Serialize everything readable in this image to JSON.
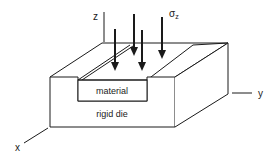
{
  "diagram": {
    "labels": {
      "material": "material",
      "die": "rigid die",
      "stress_symbol": "σ",
      "stress_subscript": "z",
      "axis_x": "x",
      "axis_y": "y",
      "axis_z": "z"
    },
    "colors": {
      "stroke": "#1a1a1a",
      "background": "#ffffff"
    },
    "arrows": [
      {
        "name": "stress-arrow-1",
        "x": 115,
        "y1": 29,
        "y2": 70
      },
      {
        "name": "stress-arrow-2",
        "x": 134,
        "y1": 14,
        "y2": 55
      },
      {
        "name": "stress-arrow-3",
        "x": 142,
        "y1": 30,
        "y2": 71
      },
      {
        "name": "stress-arrow-4",
        "x": 162,
        "y1": 17,
        "y2": 58
      }
    ]
  }
}
